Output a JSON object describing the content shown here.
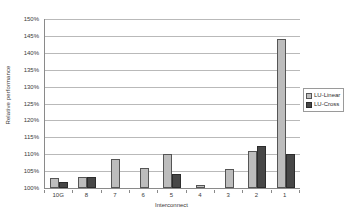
{
  "chart_data": {
    "type": "bar",
    "title": "",
    "xlabel": "Interconnect",
    "ylabel": "Relative performance",
    "categories": [
      "10G",
      "8",
      "7",
      "6",
      "5",
      "4",
      "3",
      "2",
      "1"
    ],
    "series": [
      {
        "name": "LU-Linear",
        "color": "#bdbdbd",
        "values": [
          103.0,
          103.2,
          108.5,
          106.0,
          110.2,
          101.0,
          105.5,
          111.0,
          144.0
        ]
      },
      {
        "name": "LU-Cross",
        "color": "#474747",
        "values": [
          101.7,
          103.2,
          100.0,
          100.0,
          104.0,
          100.0,
          100.0,
          112.5,
          110.0
        ]
      }
    ],
    "ylim": [
      100,
      150
    ],
    "ytick_step": 5,
    "ytick_labels": [
      "100%",
      "105%",
      "110%",
      "115%",
      "120%",
      "125%",
      "130%",
      "135%",
      "140%",
      "145%",
      "150%"
    ],
    "ytick_values": [
      100,
      105,
      110,
      115,
      120,
      125,
      130,
      135,
      140,
      145,
      150
    ],
    "grid": true,
    "legend_position": "right"
  },
  "legend": {
    "entries": [
      {
        "label": "LU-Linear"
      },
      {
        "label": "LU-Cross"
      }
    ]
  },
  "colors": {
    "linear": "#bdbdbd",
    "cross": "#474747",
    "grid": "#b9b9b9",
    "axis": "#8a8a8a",
    "text": "#3a3a3a",
    "background": "#ffffff"
  }
}
